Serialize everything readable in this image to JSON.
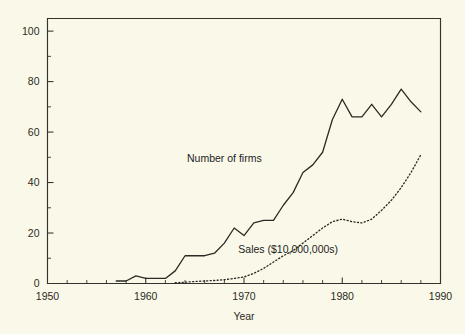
{
  "chart_data": {
    "type": "line",
    "title": "",
    "subtitle": "",
    "xlabel": "Year",
    "ylabel": "",
    "xlim": [
      1950,
      1990
    ],
    "ylim": [
      0,
      105
    ],
    "grid": false,
    "legend_position": "inline-annotation",
    "x_ticks_major": [
      1950,
      1960,
      1970,
      1980,
      1990
    ],
    "x_tick_labels": [
      "1950",
      "1960",
      "1970",
      "1980",
      "1990"
    ],
    "x_tick_minor_step": 2,
    "y_ticks_major": [
      0,
      20,
      40,
      60,
      80,
      100
    ],
    "y_tick_labels": [
      "0",
      "20",
      "40",
      "60",
      "80",
      "100"
    ],
    "y_tick_minor_step": 10,
    "series": [
      {
        "name": "Number of firms",
        "style": "solid",
        "annotation": "Number of firms",
        "annotation_x": 1968.0,
        "annotation_y": 48.0,
        "x": [
          1957,
          1958,
          1959,
          1960,
          1961,
          1962,
          1963,
          1964,
          1965,
          1966,
          1967,
          1968,
          1969,
          1970,
          1971,
          1972,
          1973,
          1974,
          1975,
          1976,
          1977,
          1978,
          1979,
          1980,
          1981,
          1982,
          1983,
          1984,
          1985,
          1986,
          1987,
          1988
        ],
        "values": [
          1,
          1,
          3,
          2,
          2,
          2,
          5,
          11,
          11,
          11,
          12,
          16,
          22,
          19,
          24,
          25,
          25,
          31,
          36,
          44,
          47,
          52,
          65,
          73,
          66,
          66,
          71,
          66,
          71,
          77,
          72,
          68
        ]
      },
      {
        "name": "Sales ($10,000,000s)",
        "style": "dotted",
        "annotation": "Sales ($10,000,000s)",
        "annotation_x": 1974.5,
        "annotation_y": 12.0,
        "x": [
          1963,
          1964,
          1965,
          1966,
          1967,
          1968,
          1969,
          1970,
          1971,
          1972,
          1973,
          1974,
          1975,
          1976,
          1977,
          1978,
          1979,
          1980,
          1981,
          1982,
          1983,
          1984,
          1985,
          1986,
          1987,
          1988
        ],
        "values": [
          0.3,
          0.5,
          0.8,
          1.0,
          1.2,
          1.5,
          2.0,
          2.6,
          4.0,
          6.0,
          8.5,
          11.0,
          13.0,
          16.0,
          19.0,
          22.0,
          24.5,
          25.5,
          24.5,
          24.0,
          25.5,
          29.0,
          33.0,
          38.0,
          44.0,
          51.0
        ]
      }
    ]
  },
  "colors": {
    "background": "#faf9e9",
    "axis": "#33322c",
    "series": "#2b2a24"
  }
}
